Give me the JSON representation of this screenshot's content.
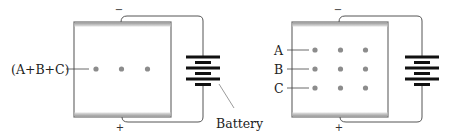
{
  "figure": {
    "left_panel": {
      "label": "(A+B+C)",
      "battery_label": "Battery",
      "negative_sign": "−",
      "positive_sign": "+",
      "dots_per_row": 3,
      "rows": 1
    },
    "right_panel": {
      "row_labels": [
        "A",
        "B",
        "C"
      ],
      "negative_sign": "−",
      "positive_sign": "+",
      "dots_per_row": 3,
      "rows": 3
    },
    "colors": {
      "frame": "#6e6e6e",
      "electrode_band": "#c8c8c8",
      "dot": "#8c8c8c",
      "battery": "#111111",
      "wire": "#555555"
    }
  }
}
